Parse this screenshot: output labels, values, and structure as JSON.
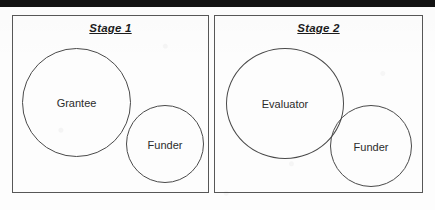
{
  "figure": {
    "kind": "two-panel-venn-diagram",
    "panels": [
      {
        "id": "stage-1",
        "title": "Stage 1",
        "circles": [
          {
            "id": "grantee",
            "label": "Grantee",
            "size": "large"
          },
          {
            "id": "funder",
            "label": "Funder",
            "size": "small"
          }
        ]
      },
      {
        "id": "stage-2",
        "title": "Stage 2",
        "circles": [
          {
            "id": "evaluator",
            "label": "Evaluator",
            "size": "large"
          },
          {
            "id": "funder",
            "label": "Funder",
            "size": "small"
          }
        ]
      }
    ]
  },
  "colors": {
    "background": "#fdfdfd",
    "panel_border": "#575757",
    "circle_stroke": "#4a4a4a",
    "title_text": "#1c1c1c",
    "label_text": "#2b2b2b",
    "scan_band": "#111111"
  }
}
